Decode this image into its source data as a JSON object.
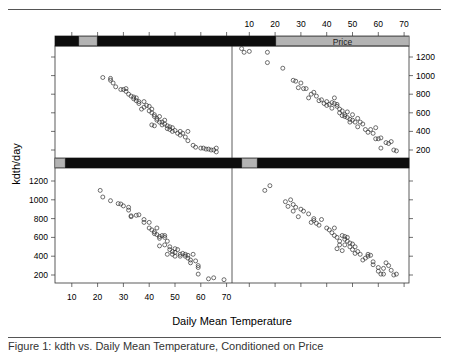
{
  "figure": {
    "caption": "Figure 1: kdth vs. Daily Mean Temperature, Conditioned on Price"
  },
  "chart_data": {
    "type": "scatter",
    "layout": "lattice 2x2 (trellis), conditioned on Price shingle",
    "title": "",
    "xlabel": "Daily Mean Temperature",
    "ylabel": "kdth/day",
    "xlim": [
      5,
      72
    ],
    "ylim": [
      80,
      1340
    ],
    "x_ticks": [
      10,
      20,
      30,
      40,
      50,
      60,
      70
    ],
    "y_ticks": [
      200,
      400,
      600,
      800,
      1000,
      1200
    ],
    "strip_label": "Price",
    "grid": false,
    "legend": null,
    "panels": [
      {
        "name": "bottom-left",
        "row": 2,
        "col": 1,
        "strip_range_frac": [
          0.0,
          0.04
        ],
        "points": [
          [
            21,
            1100
          ],
          [
            22,
            1030
          ],
          [
            25,
            990
          ],
          [
            28,
            960
          ],
          [
            29,
            955
          ],
          [
            30,
            935
          ],
          [
            32,
            920
          ],
          [
            32,
            890
          ],
          [
            33,
            830
          ],
          [
            33,
            820
          ],
          [
            35,
            835
          ],
          [
            36,
            840
          ],
          [
            38,
            790
          ],
          [
            38,
            760
          ],
          [
            40,
            760
          ],
          [
            40,
            700
          ],
          [
            41,
            680
          ],
          [
            42,
            660
          ],
          [
            42,
            640
          ],
          [
            43,
            700
          ],
          [
            43,
            630
          ],
          [
            44,
            610
          ],
          [
            44,
            590
          ],
          [
            45,
            620
          ],
          [
            46,
            620
          ],
          [
            46,
            600
          ],
          [
            47,
            560
          ],
          [
            44,
            510
          ],
          [
            46,
            520
          ],
          [
            48,
            500
          ],
          [
            48,
            470
          ],
          [
            49,
            450
          ],
          [
            49,
            420
          ],
          [
            50,
            480
          ],
          [
            50,
            440
          ],
          [
            51,
            470
          ],
          [
            52,
            420
          ],
          [
            52,
            400
          ],
          [
            53,
            430
          ],
          [
            54,
            420
          ],
          [
            54,
            400
          ],
          [
            55,
            410
          ],
          [
            55,
            380
          ],
          [
            56,
            360
          ],
          [
            56,
            330
          ],
          [
            57,
            420
          ],
          [
            58,
            350
          ],
          [
            59,
            300
          ],
          [
            59,
            280
          ],
          [
            59,
            210
          ],
          [
            63,
            160
          ],
          [
            65,
            170
          ],
          [
            66,
            130
          ],
          [
            69,
            150
          ],
          [
            47,
            420
          ],
          [
            50,
            400
          ]
        ]
      },
      {
        "name": "bottom-right",
        "row": 2,
        "col": 2,
        "strip_range_frac": [
          0.0,
          0.12
        ],
        "points": [
          [
            16,
            1100
          ],
          [
            18,
            1150
          ],
          [
            24,
            980
          ],
          [
            26,
            1000
          ],
          [
            27,
            950
          ],
          [
            25,
            930
          ],
          [
            28,
            920
          ],
          [
            27,
            880
          ],
          [
            30,
            900
          ],
          [
            31,
            880
          ],
          [
            29,
            820
          ],
          [
            33,
            850
          ],
          [
            35,
            800
          ],
          [
            35,
            780
          ],
          [
            36,
            750
          ],
          [
            37,
            730
          ],
          [
            38,
            790
          ],
          [
            34,
            760
          ],
          [
            40,
            700
          ],
          [
            41,
            680
          ],
          [
            42,
            650
          ],
          [
            43,
            700
          ],
          [
            43,
            620
          ],
          [
            44,
            600
          ],
          [
            45,
            560
          ],
          [
            45,
            520
          ],
          [
            46,
            620
          ],
          [
            47,
            610
          ],
          [
            47,
            580
          ],
          [
            48,
            600
          ],
          [
            48,
            560
          ],
          [
            49,
            540
          ],
          [
            49,
            500
          ],
          [
            50,
            530
          ],
          [
            50,
            470
          ],
          [
            51,
            500
          ],
          [
            52,
            450
          ],
          [
            53,
            420
          ],
          [
            54,
            360
          ],
          [
            55,
            380
          ],
          [
            56,
            400
          ],
          [
            56,
            420
          ],
          [
            57,
            410
          ],
          [
            58,
            340
          ],
          [
            58,
            310
          ],
          [
            60,
            280
          ],
          [
            60,
            240
          ],
          [
            61,
            210
          ],
          [
            62,
            210
          ],
          [
            62,
            270
          ],
          [
            63,
            330
          ],
          [
            64,
            300
          ],
          [
            65,
            250
          ],
          [
            66,
            200
          ],
          [
            67,
            210
          ],
          [
            68,
            120
          ],
          [
            44,
            480
          ],
          [
            46,
            460
          ],
          [
            47,
            520
          ],
          [
            51,
            430
          ]
        ]
      },
      {
        "name": "top-left",
        "row": 1,
        "col": 1,
        "strip_range_frac": [
          0.08,
          0.12
        ],
        "points": [
          [
            22,
            980
          ],
          [
            25,
            970
          ],
          [
            25,
            950
          ],
          [
            26,
            920
          ],
          [
            27,
            880
          ],
          [
            29,
            850
          ],
          [
            30,
            850
          ],
          [
            31,
            860
          ],
          [
            31,
            830
          ],
          [
            32,
            800
          ],
          [
            33,
            780
          ],
          [
            34,
            770
          ],
          [
            34,
            750
          ],
          [
            35,
            760
          ],
          [
            35,
            730
          ],
          [
            36,
            720
          ],
          [
            36,
            700
          ],
          [
            37,
            640
          ],
          [
            38,
            660
          ],
          [
            39,
            680
          ],
          [
            40,
            670
          ],
          [
            40,
            620
          ],
          [
            41,
            640
          ],
          [
            41,
            600
          ],
          [
            42,
            580
          ],
          [
            42,
            560
          ],
          [
            43,
            540
          ],
          [
            43,
            520
          ],
          [
            44,
            500
          ],
          [
            44,
            560
          ],
          [
            45,
            500
          ],
          [
            45,
            470
          ],
          [
            46,
            480
          ],
          [
            46,
            520
          ],
          [
            47,
            460
          ],
          [
            47,
            430
          ],
          [
            48,
            450
          ],
          [
            48,
            420
          ],
          [
            49,
            400
          ],
          [
            49,
            440
          ],
          [
            50,
            410
          ],
          [
            51,
            380
          ],
          [
            52,
            360
          ],
          [
            52,
            400
          ],
          [
            53,
            380
          ],
          [
            54,
            340
          ],
          [
            55,
            400
          ],
          [
            55,
            300
          ],
          [
            57,
            250
          ],
          [
            58,
            230
          ],
          [
            60,
            220
          ],
          [
            61,
            220
          ],
          [
            62,
            210
          ],
          [
            63,
            210
          ],
          [
            64,
            200
          ],
          [
            65,
            200
          ],
          [
            66,
            220
          ],
          [
            66,
            180
          ],
          [
            41,
            470
          ],
          [
            42,
            460
          ],
          [
            38,
            720
          ]
        ]
      },
      {
        "name": "top-right",
        "row": 1,
        "col": 2,
        "strip_range_frac": [
          0.22,
          1.0
        ],
        "points": [
          [
            7,
            1290
          ],
          [
            8,
            1250
          ],
          [
            10,
            1260
          ],
          [
            17,
            1250
          ],
          [
            17,
            1140
          ],
          [
            23,
            1080
          ],
          [
            27,
            950
          ],
          [
            28,
            940
          ],
          [
            30,
            920
          ],
          [
            29,
            870
          ],
          [
            31,
            860
          ],
          [
            32,
            860
          ],
          [
            33,
            760
          ],
          [
            34,
            800
          ],
          [
            35,
            820
          ],
          [
            36,
            780
          ],
          [
            37,
            730
          ],
          [
            38,
            740
          ],
          [
            39,
            700
          ],
          [
            40,
            680
          ],
          [
            40,
            720
          ],
          [
            41,
            690
          ],
          [
            42,
            710
          ],
          [
            43,
            760
          ],
          [
            43,
            700
          ],
          [
            44,
            690
          ],
          [
            45,
            640
          ],
          [
            45,
            600
          ],
          [
            46,
            620
          ],
          [
            47,
            580
          ],
          [
            47,
            560
          ],
          [
            48,
            610
          ],
          [
            48,
            550
          ],
          [
            49,
            530
          ],
          [
            49,
            500
          ],
          [
            50,
            580
          ],
          [
            50,
            520
          ],
          [
            51,
            500
          ],
          [
            52,
            540
          ],
          [
            52,
            450
          ],
          [
            53,
            500
          ],
          [
            54,
            480
          ],
          [
            55,
            420
          ],
          [
            56,
            390
          ],
          [
            57,
            420
          ],
          [
            58,
            380
          ],
          [
            59,
            440
          ],
          [
            59,
            320
          ],
          [
            60,
            320
          ],
          [
            61,
            330
          ],
          [
            61,
            220
          ],
          [
            63,
            280
          ],
          [
            64,
            270
          ],
          [
            65,
            290
          ],
          [
            66,
            200
          ],
          [
            67,
            190
          ],
          [
            42,
            650
          ],
          [
            44,
            670
          ],
          [
            46,
            570
          ]
        ]
      }
    ]
  }
}
